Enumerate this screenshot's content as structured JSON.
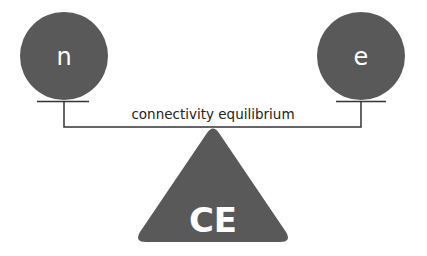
{
  "diagram": {
    "nodes": [
      {
        "id": "left",
        "label": "n"
      },
      {
        "id": "right",
        "label": "e"
      }
    ],
    "connection_label": "connectivity equilibrium",
    "fulcrum_label": "CE",
    "colors": {
      "shape_fill": "#595959",
      "line": "#333333",
      "text_on_shape": "#ffffff",
      "text": "#222222"
    }
  }
}
